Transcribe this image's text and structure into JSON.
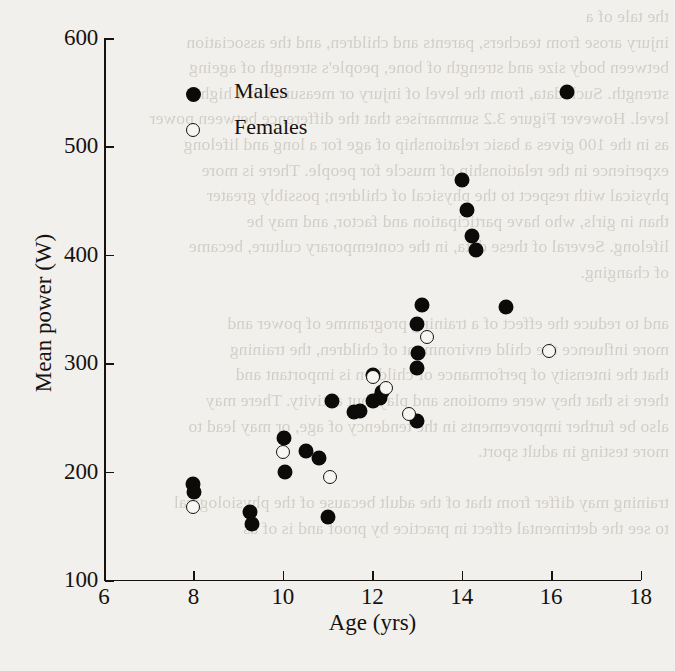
{
  "chart_data": {
    "type": "scatter",
    "title": "",
    "xlabel": "Age (yrs)",
    "ylabel": "Mean power (W)",
    "xlim": [
      6,
      18
    ],
    "ylim": [
      100,
      600
    ],
    "xticks": [
      6,
      8,
      10,
      12,
      14,
      16,
      18
    ],
    "yticks": [
      100,
      200,
      300,
      400,
      500,
      600
    ],
    "grid": false,
    "legend_position": "top-left",
    "series": [
      {
        "name": "Males",
        "marker": "filled-circle",
        "color": "#0d0b09",
        "points": [
          [
            8.0,
            189
          ],
          [
            8.02,
            181
          ],
          [
            9.27,
            163
          ],
          [
            9.3,
            152
          ],
          [
            10.02,
            231
          ],
          [
            10.05,
            200
          ],
          [
            10.52,
            219
          ],
          [
            10.8,
            213
          ],
          [
            11.02,
            158
          ],
          [
            11.1,
            265
          ],
          [
            11.6,
            255
          ],
          [
            11.72,
            256
          ],
          [
            12.02,
            289
          ],
          [
            12.02,
            265
          ],
          [
            12.18,
            268
          ],
          [
            12.22,
            273
          ],
          [
            13.0,
            247
          ],
          [
            13.0,
            296
          ],
          [
            13.02,
            309
          ],
          [
            13.0,
            336
          ],
          [
            13.12,
            354
          ],
          [
            14.0,
            469
          ],
          [
            14.12,
            441
          ],
          [
            14.22,
            417
          ],
          [
            14.32,
            404
          ],
          [
            15.0,
            352
          ],
          [
            16.35,
            550
          ]
        ]
      },
      {
        "name": "Females",
        "marker": "open-circle",
        "color": "#f7f6f3",
        "points": [
          [
            8.0,
            167
          ],
          [
            10.0,
            218
          ],
          [
            11.05,
            195
          ],
          [
            12.02,
            287
          ],
          [
            12.3,
            277
          ],
          [
            12.82,
            253
          ],
          [
            13.22,
            324
          ],
          [
            15.95,
            311
          ]
        ]
      }
    ]
  },
  "legend": {
    "items": [
      {
        "label": "Males",
        "marker": "filled-circle"
      },
      {
        "label": "Females",
        "marker": "open-circle"
      }
    ]
  },
  "bleed_text": "the tale of a\ninjury arose from teachers, parents and children, and the association\nbetween body size and strength of bone, people's strength of ageing\nstrength. Such data, from the level of injury or measured in a high\nlevel. However Figure 3.2 summarises that the difference between power\nas in the 100 gives a basic relationship of age for a long and lifelong\nexperience in the relationship of muscle for people. There is more\nphysical with respect to the physical of children; possibly greater\nthan in girls, who have participation and factor, and may be\nlifelong. Several of these data, in the contemporary culture, became\nof changing.\n\nand to reduce the effect of a training programme of power and\nmore influence the child environment of children, the training\nthat the intensity of performance of children is important and\nthere is that they were emotions and play, but activity. There may\nalso be further improvements in the tendency of age, or may lead to\nmore testing in adult sport.\n\ntraining may differ from that of the adult because of the physiological\nto see the detrimental effect in practice by proof and is of as"
}
